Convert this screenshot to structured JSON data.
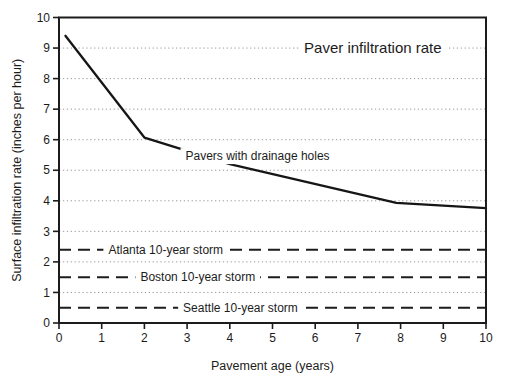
{
  "figure": {
    "background_color": "#ffffff",
    "ink_color": "#1c1c1c",
    "grid_color": "#9b9b9b",
    "line_color": "#161616"
  },
  "chart_data": {
    "type": "line",
    "title": "Paver infiltration rate",
    "title_pos": {
      "x": 7.35,
      "y": 9.0
    },
    "xlabel": "Pavement age (years)",
    "ylabel": "Surface infiltration rate (inches per hour)",
    "xlim": [
      0,
      10
    ],
    "ylim": [
      0,
      10
    ],
    "x_ticks": [
      0,
      1,
      2,
      3,
      4,
      5,
      6,
      7,
      8,
      9,
      10
    ],
    "y_ticks": [
      0,
      1,
      2,
      3,
      4,
      5,
      6,
      7,
      8,
      9,
      10
    ],
    "grid_y": [
      1,
      2,
      3,
      4,
      5,
      6,
      7,
      8,
      9
    ],
    "grid_style": "dotted",
    "legend_position": "none",
    "series": [
      {
        "name": "Pavers with drainage holes",
        "style": "solid",
        "points": [
          [
            0.15,
            9.4
          ],
          [
            2,
            6.07
          ],
          [
            4,
            5.2
          ],
          [
            7.9,
            3.93
          ],
          [
            10,
            3.76
          ]
        ],
        "label": {
          "text": "Pavers with drainage holes",
          "x": 4.65,
          "y": 5.47
        }
      },
      {
        "name": "Atlanta 10-year storm",
        "style": "dashed",
        "hline": 2.4,
        "label": {
          "text": "Atlanta 10-year storm",
          "x": 2.5,
          "y": 2.4
        }
      },
      {
        "name": "Boston 10-year storm",
        "style": "dashed",
        "hline": 1.5,
        "label": {
          "text": "Boston 10-year storm",
          "x": 3.25,
          "y": 1.5
        }
      },
      {
        "name": "Seattle 10-year storm",
        "style": "dashed",
        "hline": 0.5,
        "label": {
          "text": "Seattle 10-year storm",
          "x": 4.25,
          "y": 0.5
        }
      }
    ]
  }
}
